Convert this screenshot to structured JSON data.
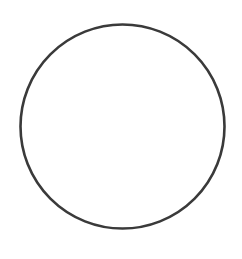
{
  "figure": {
    "background": "#ffffff",
    "shapes": [
      {
        "type": "circle",
        "cx": 122.5,
        "cy": 126.5,
        "r": 102,
        "stroke": "#3a3a3a",
        "stroke_width": 2.6,
        "fill": "none"
      }
    ]
  }
}
